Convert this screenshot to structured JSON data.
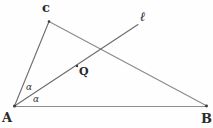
{
  "figure": {
    "background_color": "#fefefe",
    "stroke_color": "#5a5a5a",
    "label_color": "#2a2a2a",
    "width": 213,
    "height": 128,
    "vertices": [
      {
        "id": "A",
        "label": "A",
        "x": 14,
        "y": 106
      },
      {
        "id": "B",
        "label": "B",
        "x": 207,
        "y": 106
      },
      {
        "id": "C",
        "label": "c",
        "x": 49,
        "y": 21
      }
    ],
    "points": [
      {
        "id": "Q",
        "label": "Q",
        "x": 77,
        "y": 66,
        "marker": "dot"
      }
    ],
    "lines": [
      {
        "id": "AB",
        "from": "A",
        "to": "B",
        "x1": 14,
        "y1": 106,
        "x2": 207,
        "y2": 106
      },
      {
        "id": "AC",
        "from": "A",
        "to": "C",
        "x1": 14,
        "y1": 106,
        "x2": 49,
        "y2": 21
      },
      {
        "id": "CB",
        "from": "C",
        "to": "B",
        "x1": 49,
        "y1": 21,
        "x2": 207,
        "y2": 106
      },
      {
        "id": "ray-l",
        "from": "A",
        "to": "l",
        "x1": 14,
        "y1": 106,
        "x2": 138,
        "y2": 24
      }
    ],
    "line_labels": [
      {
        "id": "l",
        "label": "ℓ",
        "x": 140,
        "y": 10
      }
    ],
    "angles": [
      {
        "id": "alpha-upper",
        "label": "α",
        "x": 26,
        "y": 83,
        "between": "AC and ray-l"
      },
      {
        "id": "alpha-lower",
        "label": "α",
        "x": 33,
        "y": 95,
        "between": "ray-l and AB"
      }
    ]
  }
}
